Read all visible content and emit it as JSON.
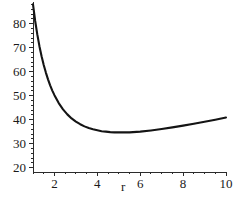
{
  "figure": {
    "background_color": "#ffffff",
    "curve_color": "#141414",
    "axis_color": "#2b2b2b",
    "text_color": "#1a1a1a"
  },
  "chart_data": {
    "type": "line",
    "title": "",
    "subtitle": "",
    "xlabel": "r",
    "ylabel": "",
    "grid": false,
    "legend": null,
    "xlim": [
      1,
      10
    ],
    "ylim": [
      18.2,
      89
    ],
    "x_ticks": [
      2,
      4,
      6,
      8,
      10
    ],
    "x_tick_labels": [
      "2",
      "4",
      "6",
      "8",
      "10"
    ],
    "x_minor_tick_step": 0.5,
    "y_ticks": [
      20,
      30,
      40,
      50,
      60,
      70,
      80
    ],
    "y_tick_labels": [
      "20",
      "30",
      "40",
      "50",
      "60",
      "70",
      "80"
    ],
    "y_minor_tick_step": 2,
    "series": [
      {
        "name": "cost",
        "x": [
          1.0,
          1.1,
          1.2,
          1.3,
          1.4,
          1.5,
          1.6,
          1.7,
          1.8,
          1.9,
          2.0,
          2.2,
          2.4,
          2.6,
          2.8,
          3.0,
          3.2,
          3.4,
          3.6,
          3.8,
          4.0,
          4.2,
          4.4,
          4.6,
          4.8,
          5.0,
          5.5,
          6.0,
          6.5,
          7.0,
          7.5,
          8.0,
          8.5,
          9.0,
          9.5,
          10.0
        ],
        "y": [
          88.0,
          81.2,
          75.5,
          70.6,
          66.4,
          62.8,
          59.6,
          56.8,
          54.3,
          52.1,
          50.2,
          46.9,
          44.3,
          42.2,
          40.5,
          39.2,
          38.1,
          37.2,
          36.5,
          36.0,
          35.6,
          35.2,
          35.0,
          34.8,
          34.7,
          34.7,
          34.7,
          35.0,
          35.5,
          36.1,
          36.8,
          37.5,
          38.3,
          39.1,
          40.0,
          40.9
        ]
      }
    ],
    "annotations": [],
    "minimum": {
      "x": 4.2,
      "y": 20.3
    },
    "endpoint_left": {
      "x": 1.0,
      "y": 88.0
    },
    "endpoint_right": {
      "x": 10.0,
      "y": 33.9
    }
  }
}
